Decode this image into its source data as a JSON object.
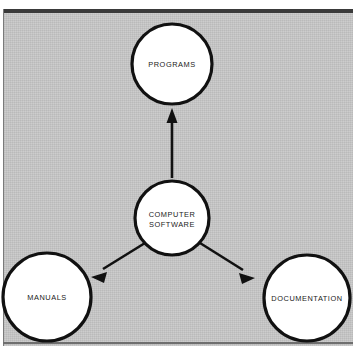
{
  "figure": {
    "background_color": "#c7c7c7",
    "node_fill": "#ffffff",
    "node_stroke": "#111111",
    "arrow_color": "#111111",
    "rule_color": "#3a3a3a"
  },
  "nodes": [
    {
      "id": "programs",
      "label_lines": [
        "PROGRAMS"
      ],
      "line1": "PROGRAMS",
      "line2": "",
      "cx": 172,
      "cy": 64,
      "r": 40
    },
    {
      "id": "computer-software",
      "label_lines": [
        "COMPUTER",
        "SOFTWARE"
      ],
      "line1": "COMPUTER",
      "line2": "SOFTWARE",
      "cx": 172,
      "cy": 218,
      "r": 37
    },
    {
      "id": "manuals",
      "label_lines": [
        "MANUALS"
      ],
      "line1": "MANUALS",
      "line2": "",
      "cx": 47,
      "cy": 297,
      "r": 44
    },
    {
      "id": "documentation",
      "label_lines": [
        "DOCUMENTATION"
      ],
      "line1": "DOCUMENTATION",
      "line2": "",
      "cx": 307,
      "cy": 298,
      "r": 43
    }
  ],
  "edges": [
    {
      "id": "software-to-programs",
      "from": "computer-software",
      "to": "programs",
      "direction": "up"
    },
    {
      "id": "software-to-manuals",
      "from": "computer-software",
      "to": "manuals",
      "direction": "down-left"
    },
    {
      "id": "software-to-documentation",
      "from": "computer-software",
      "to": "documentation",
      "direction": "down-right"
    }
  ]
}
